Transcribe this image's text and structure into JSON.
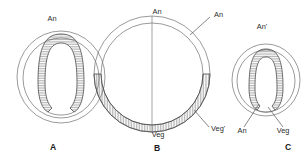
{
  "figure": {
    "background_color": "#ffffff",
    "line_color": "#6f6f6f",
    "text_color": "#2b2b2b",
    "hatch_color": "#555555"
  },
  "panels": [
    {
      "id": "A",
      "letter": "A",
      "description": "Embryo section with deep U-shaped invagination",
      "labels": [
        {
          "name": "animal-pole",
          "text": "An",
          "x": 52,
          "y": 21
        }
      ]
    },
    {
      "id": "B",
      "letter": "B",
      "description": "Spherical embryo with vegetal hatched crescent and vertical axis",
      "labels": [
        {
          "name": "animal-pole-top",
          "text": "An",
          "x": 157,
          "y": 14
        },
        {
          "name": "animal-pole-right",
          "text": "An",
          "x": 214,
          "y": 17
        },
        {
          "name": "vegetal-pole-bottom",
          "text": "Veg",
          "x": 158,
          "y": 137
        },
        {
          "name": "vegetal-pole-right",
          "text": "Veg'",
          "x": 213,
          "y": 131
        }
      ]
    },
    {
      "id": "C",
      "letter": "C",
      "description": "Smaller embryo section with invagination and pole annotations",
      "labels": [
        {
          "name": "animal-pole-prime",
          "text": "An'",
          "x": 262,
          "y": 29
        },
        {
          "name": "animal-pole-lower",
          "text": "An",
          "x": 242,
          "y": 133
        },
        {
          "name": "vegetal-pole-lower",
          "text": "Veg",
          "x": 282,
          "y": 133
        }
      ]
    }
  ],
  "panel_letters": [
    {
      "text": "A",
      "x": 53,
      "y": 150
    },
    {
      "text": "B",
      "x": 157,
      "y": 151
    },
    {
      "text": "C",
      "x": 288,
      "y": 150
    }
  ],
  "legend_terms": {
    "an": "An",
    "an_prime": "An'",
    "veg": "Veg",
    "veg_prime": "Veg'"
  }
}
